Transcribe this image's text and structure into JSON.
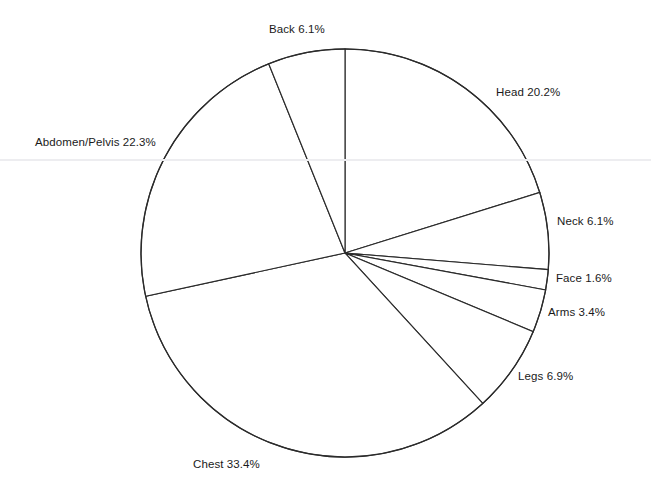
{
  "chart_data": {
    "type": "pie",
    "title": "",
    "subtitle": "",
    "xlabel": "",
    "ylabel": "",
    "legend_position": "none",
    "grid": false,
    "label_format": "{name} {value}%",
    "unit": "%",
    "start_angle_deg": 0,
    "direction": "clockwise",
    "total": 100.0,
    "categories": [
      "Head",
      "Neck",
      "Face",
      "Arms",
      "Legs",
      "Chest",
      "Abdomen/Pelvis",
      "Back"
    ],
    "values": [
      20.2,
      6.1,
      1.6,
      3.4,
      6.9,
      33.4,
      22.3,
      6.1
    ],
    "slices": [
      {
        "name": "Head",
        "value": 20.2,
        "label": "Head 20.2%",
        "label_x": 496,
        "label_y": 86,
        "label_align": "left"
      },
      {
        "name": "Neck",
        "value": 6.1,
        "label": "Neck 6.1%",
        "label_x": 557,
        "label_y": 215,
        "label_align": "left"
      },
      {
        "name": "Face",
        "value": 1.6,
        "label": "Face 1.6%",
        "label_x": 556,
        "label_y": 272,
        "label_align": "left"
      },
      {
        "name": "Arms",
        "value": 3.4,
        "label": "Arms 3.4%",
        "label_x": 548,
        "label_y": 306,
        "label_align": "left"
      },
      {
        "name": "Legs",
        "value": 6.9,
        "label": "Legs 6.9%",
        "label_x": 518,
        "label_y": 370,
        "label_align": "left"
      },
      {
        "name": "Chest",
        "value": 33.4,
        "label": "Chest 33.4%",
        "label_x": 193,
        "label_y": 458,
        "label_align": "left"
      },
      {
        "name": "Abdomen/Pelvis",
        "value": 22.3,
        "label": "Abdomen/Pelvis 22.3%",
        "label_x": 35,
        "label_y": 136,
        "label_align": "left"
      },
      {
        "name": "Back",
        "value": 6.1,
        "label": "Back 6.1%",
        "label_x": 269,
        "label_y": 23,
        "label_align": "left"
      }
    ]
  },
  "geometry": {
    "center_x": 345,
    "center_y": 253,
    "radius": 204,
    "scan_line_y": 160,
    "canvas_width": 651,
    "canvas_height": 498
  },
  "colors": {
    "background": "#ffffff",
    "slice_fill": "#ffffff",
    "slice_stroke": "#2b2b2b",
    "label_text": "#1a1a1a",
    "scan_line": "#ededf0"
  }
}
